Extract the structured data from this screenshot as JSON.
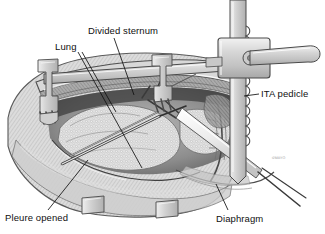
{
  "figure": {
    "background_color": "#ffffff",
    "ink_color": "#101010",
    "tone_light": "#e6e6e6",
    "tone_mid": "#9e9e9e",
    "tone_dark": "#4a4a4a",
    "width": 325,
    "height": 234
  },
  "labels": {
    "divided_sternum": "Divided sternum",
    "lung": "Lung",
    "ita_pedicle": "ITA pedicle",
    "pleure_opened": "Pleure opened",
    "diaphragm": "Diaphragm"
  },
  "watermark": {
    "text": "©MAYO"
  }
}
